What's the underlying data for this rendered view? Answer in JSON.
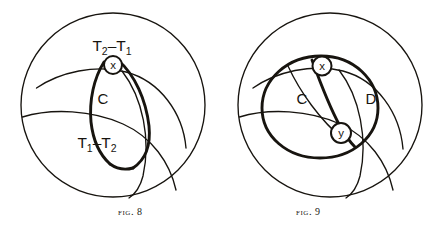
{
  "page": {
    "background_color": "#ffffff",
    "ink_color": "#17140f",
    "width": 439,
    "height": 231
  },
  "figures": [
    {
      "id": "fig8",
      "caption_word": "Fig.",
      "caption_number": "8",
      "outer_circle": {
        "cx": 113,
        "cy": 105,
        "r": 92
      },
      "labels": {
        "upper_region": {
          "base": "T",
          "sub": "2",
          "op": "–",
          "base2": "T",
          "sub2": "1",
          "text": "T₂–T₁",
          "x": 112,
          "y": 46
        },
        "lower_region": {
          "base": "T",
          "sub": "1",
          "op": "–",
          "base2": "T",
          "sub2": "2",
          "text": "T₁–T₂",
          "x": 97,
          "y": 143
        },
        "lens": {
          "text": "C",
          "x": 103,
          "y": 100
        },
        "micro_x": {
          "text": "x",
          "cx": 113,
          "cy": 65,
          "r": 9
        }
      }
    },
    {
      "id": "fig9",
      "caption_word": "Fig.",
      "caption_number": "9",
      "outer_circle": {
        "cx": 330,
        "cy": 105,
        "r": 92
      },
      "labels": {
        "lens_left": {
          "text": "C",
          "x": 302,
          "y": 100
        },
        "lens_right": {
          "text": "D",
          "x": 371,
          "y": 100
        },
        "micro_x": {
          "text": "x",
          "cx": 322,
          "cy": 66,
          "r": 9.5
        },
        "micro_y": {
          "text": "y",
          "cx": 341,
          "cy": 133,
          "r": 10
        }
      }
    }
  ]
}
